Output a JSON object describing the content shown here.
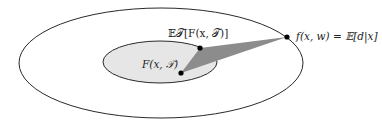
{
  "diagram": {
    "type": "nested-ellipses",
    "outer_ellipse": {
      "cx": 161,
      "cy": 63,
      "rx": 142,
      "ry": 55,
      "fill": "#ffffff",
      "stroke": "#2a2a2a"
    },
    "inner_ellipse": {
      "cx": 160,
      "cy": 62,
      "rx": 57,
      "ry": 21,
      "fill": "#e6e6e6",
      "stroke": "#2a2a2a"
    },
    "triangle": {
      "points": "200,48 181,73 287,37",
      "fill": "#8c8c8c"
    },
    "points": [
      {
        "id": "expected-F",
        "x": 200,
        "y": 48,
        "label": "𝔼𝒯[F(x, 𝒯)]",
        "label_x": 168,
        "label_y": 37
      },
      {
        "id": "F",
        "x": 181,
        "y": 73,
        "label": "F(x, 𝒯)",
        "label_x": 142,
        "label_y": 68
      },
      {
        "id": "f-regression",
        "x": 287,
        "y": 37,
        "label": "f(x, w) = 𝔼[d|x]",
        "label_x": 296,
        "label_y": 40
      }
    ]
  },
  "labels": {
    "expected_F": "𝔼𝒯[F(x, 𝒯)]",
    "F": "F(x, 𝒯)",
    "f_regression": "f(x, w) = 𝔼[d|x]"
  },
  "colors": {
    "stroke": "#2a2a2a",
    "inner_fill": "#e6e6e6",
    "triangle_fill": "#8c8c8c",
    "point": "#000000"
  }
}
